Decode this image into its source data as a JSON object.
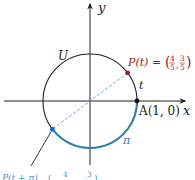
{
  "diagram": {
    "type": "unit-circle",
    "labels": {
      "x_axis": "x",
      "y_axis": "y",
      "circle": "U",
      "point_A": "A(1, 0)",
      "point_P_prefix": "P(t) = ",
      "point_P_coords": {
        "x_num": "4",
        "x_den": "5",
        "y_num": "3",
        "y_den": "5"
      },
      "arc_t": "t",
      "arc_pi": "π",
      "bottom_label_fragment": "P(t + π) = (−4/5, −3/5)"
    },
    "points": {
      "P": {
        "x": 0.8,
        "y": 0.6
      },
      "A": {
        "x": 1,
        "y": 0
      },
      "P_plus_pi": {
        "x": -0.8,
        "y": -0.6
      }
    },
    "colors": {
      "axis": "#222222",
      "circle": "#222222",
      "point_P": "#9b1b2a",
      "label_P": "#9b1b2a",
      "arc_pi": "#2a7fb5",
      "point_P_plus_pi": "#1f6fae",
      "dashed_line": "#5b9bd5",
      "label_bottom": "#2a7fb5"
    }
  }
}
